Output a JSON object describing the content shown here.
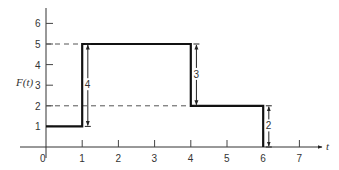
{
  "chart_data": {
    "type": "line",
    "subtype": "step",
    "title": "",
    "xlabel": "t",
    "ylabel": "F(t)",
    "xlim": [
      0,
      7.5
    ],
    "ylim": [
      0,
      6.8
    ],
    "x_ticks": [
      "0",
      "1",
      "2",
      "3",
      "4",
      "5",
      "6",
      "7"
    ],
    "y_ticks": [
      "1",
      "2",
      "3",
      "4",
      "5",
      "6"
    ],
    "grid": false,
    "series": [
      {
        "name": "F(t)",
        "x": [
          0,
          1,
          1,
          4,
          4,
          6,
          6
        ],
        "y": [
          1,
          1,
          5,
          5,
          2,
          2,
          0
        ]
      }
    ],
    "reference_lines": [
      {
        "type": "dashed",
        "y": 5,
        "x_from": 0,
        "x_to": 4
      },
      {
        "type": "dashed",
        "y": 2,
        "x_from": 0,
        "x_to": 6
      }
    ],
    "annotations": [
      {
        "type": "double-arrow",
        "x": 1.1,
        "y_from": 1,
        "y_to": 5,
        "label": "4"
      },
      {
        "type": "double-arrow",
        "x": 4.1,
        "y_from": 2,
        "y_to": 5,
        "label": "3"
      },
      {
        "type": "double-arrow",
        "x": 6.1,
        "y_from": 0,
        "y_to": 2,
        "label": "2"
      }
    ]
  }
}
